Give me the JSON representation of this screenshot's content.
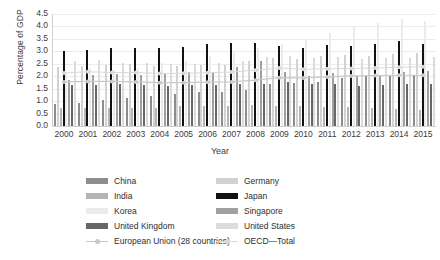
{
  "chart_data": {
    "type": "bar",
    "title": "",
    "xlabel": "Year",
    "ylabel": "Percentage of GDP",
    "ylim": [
      0,
      4.5
    ],
    "ystep": 0.5,
    "yticks": [
      "0.0",
      "0.5",
      "1.0",
      "1.5",
      "2.0",
      "2.5",
      "3.0",
      "3.5",
      "4.0",
      "4.5"
    ],
    "grid": true,
    "legend_position": "bottom",
    "categories": [
      "2000",
      "2001",
      "2002",
      "2003",
      "2004",
      "2005",
      "2006",
      "2007",
      "2008",
      "2009",
      "2010",
      "2011",
      "2012",
      "2013",
      "2014",
      "2015"
    ],
    "series": [
      {
        "name": "China",
        "kind": "bar",
        "color": "#8d8d8d",
        "values": [
          0.89,
          0.94,
          1.06,
          1.12,
          1.21,
          1.3,
          1.37,
          1.38,
          1.46,
          1.68,
          1.71,
          1.77,
          1.91,
          1.99,
          2.02,
          2.06
        ]
      },
      {
        "name": "Germany",
        "kind": "bar",
        "color": "#d2d2d2",
        "values": [
          2.39,
          2.42,
          2.46,
          2.49,
          2.43,
          2.43,
          2.46,
          2.45,
          2.6,
          2.72,
          2.71,
          2.8,
          2.87,
          2.82,
          2.88,
          2.92
        ]
      },
      {
        "name": "India",
        "kind": "bar",
        "color": "#b5b5b5",
        "values": [
          0.74,
          0.73,
          0.71,
          0.71,
          0.74,
          0.81,
          0.8,
          0.79,
          0.84,
          0.82,
          0.8,
          0.76,
          0.78,
          0.71,
          0.69,
          0.63
        ]
      },
      {
        "name": "Japan",
        "kind": "bar",
        "color": "#111111",
        "values": [
          3.0,
          3.07,
          3.12,
          3.14,
          3.13,
          3.18,
          3.28,
          3.34,
          3.34,
          3.23,
          3.14,
          3.24,
          3.21,
          3.31,
          3.4,
          3.28
        ]
      },
      {
        "name": "Korea",
        "kind": "bar",
        "color": "#ebebeb",
        "values": [
          2.18,
          2.34,
          2.27,
          2.35,
          2.53,
          2.63,
          2.83,
          3.0,
          3.12,
          3.29,
          3.47,
          3.74,
          4.03,
          4.15,
          4.29,
          4.23
        ]
      },
      {
        "name": "Singapore",
        "kind": "bar",
        "color": "#a0a0a0",
        "values": [
          1.85,
          2.04,
          2.09,
          2.05,
          2.13,
          2.19,
          2.16,
          2.36,
          2.62,
          2.16,
          2.01,
          2.15,
          2.0,
          2.0,
          2.19,
          2.2
        ]
      },
      {
        "name": "United Kingdom",
        "kind": "bar",
        "color": "#666666",
        "values": [
          1.63,
          1.64,
          1.68,
          1.63,
          1.61,
          1.63,
          1.65,
          1.69,
          1.69,
          1.75,
          1.69,
          1.69,
          1.61,
          1.66,
          1.67,
          1.67
        ]
      },
      {
        "name": "United States",
        "kind": "bar",
        "color": "#dcdcdc",
        "values": [
          2.62,
          2.64,
          2.55,
          2.55,
          2.49,
          2.51,
          2.55,
          2.63,
          2.77,
          2.82,
          2.74,
          2.77,
          2.69,
          2.72,
          2.75,
          2.79
        ]
      },
      {
        "name": "European Union (28 countries)",
        "kind": "line",
        "color": "#c9c9c9",
        "values": [
          1.77,
          1.79,
          1.79,
          1.77,
          1.74,
          1.74,
          1.76,
          1.77,
          1.84,
          1.94,
          1.93,
          1.97,
          2.01,
          2.03,
          2.04,
          2.04
        ]
      },
      {
        "name": "OECD—Total",
        "kind": "line",
        "color": "#dadada",
        "values": [
          2.13,
          2.18,
          2.15,
          2.15,
          2.11,
          2.12,
          2.14,
          2.17,
          2.24,
          2.33,
          2.28,
          2.3,
          2.31,
          2.33,
          2.36,
          2.38
        ]
      }
    ]
  },
  "legend": {
    "items": [
      {
        "label": "China",
        "swatch": "#8d8d8d",
        "kind": "bar"
      },
      {
        "label": "Germany",
        "swatch": "#d2d2d2",
        "kind": "bar"
      },
      {
        "label": "India",
        "swatch": "#b5b5b5",
        "kind": "bar"
      },
      {
        "label": "Japan",
        "swatch": "#111111",
        "kind": "bar"
      },
      {
        "label": "Korea",
        "swatch": "#ebebeb",
        "kind": "bar"
      },
      {
        "label": "Singapore",
        "swatch": "#a0a0a0",
        "kind": "bar"
      },
      {
        "label": "United Kingdom",
        "swatch": "#666666",
        "kind": "bar"
      },
      {
        "label": "United States",
        "swatch": "#dcdcdc",
        "kind": "bar"
      },
      {
        "label": "European Union (28 countries)",
        "swatch": "#c9c9c9",
        "kind": "line"
      },
      {
        "label": "OECD—Total",
        "swatch": "#dadada",
        "kind": "line"
      }
    ]
  }
}
